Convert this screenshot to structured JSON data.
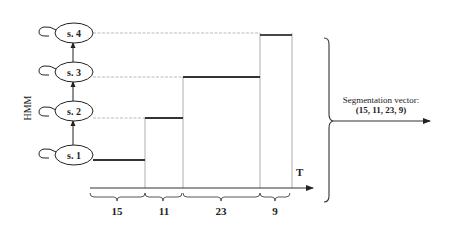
{
  "diagram": {
    "model_label": "HMM",
    "states": [
      {
        "id": "s1",
        "label": "s. 1"
      },
      {
        "id": "s2",
        "label": "s. 2"
      },
      {
        "id": "s3",
        "label": "s. 3"
      },
      {
        "id": "s4",
        "label": "s. 4"
      }
    ],
    "time_axis_label": "T",
    "segments": [
      {
        "state": "s1",
        "length": 15,
        "label": "15"
      },
      {
        "state": "s2",
        "length": 11,
        "label": "11"
      },
      {
        "state": "s3",
        "length": 23,
        "label": "23"
      },
      {
        "state": "s4",
        "length": 9,
        "label": "9"
      }
    ],
    "output": {
      "title": "Segmentation vector:",
      "value": "(15, 11, 23, 9)"
    },
    "colors": {
      "line": "#333333",
      "thin_line": "#999999",
      "background": "#ffffff"
    }
  }
}
